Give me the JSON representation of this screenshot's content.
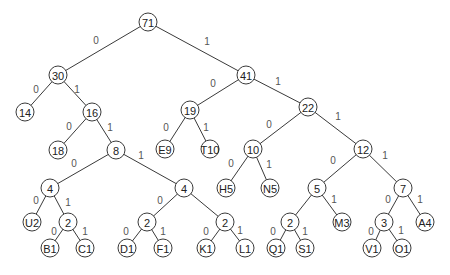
{
  "diagram": {
    "type": "huffman-tree",
    "colors": {
      "stroke": "#3a3a3a",
      "text": "#222222",
      "edge_label": "#555555",
      "background": "#ffffff"
    },
    "node_radius": 9,
    "nodes": [
      {
        "id": "n71",
        "label": "71",
        "x": 148,
        "y": 22
      },
      {
        "id": "n30",
        "label": "30",
        "x": 58,
        "y": 75
      },
      {
        "id": "n41",
        "label": "41",
        "x": 246,
        "y": 75
      },
      {
        "id": "n14",
        "label": "14",
        "x": 25,
        "y": 112
      },
      {
        "id": "n16",
        "label": "16",
        "x": 92,
        "y": 112
      },
      {
        "id": "n19",
        "label": "19",
        "x": 190,
        "y": 110
      },
      {
        "id": "n22",
        "label": "22",
        "x": 308,
        "y": 107
      },
      {
        "id": "n18",
        "label": "18",
        "x": 58,
        "y": 150
      },
      {
        "id": "n8",
        "label": "8",
        "x": 116,
        "y": 150
      },
      {
        "id": "nE9",
        "label": "E9",
        "x": 165,
        "y": 149
      },
      {
        "id": "nT10",
        "label": "T10",
        "x": 210,
        "y": 149
      },
      {
        "id": "n10",
        "label": "10",
        "x": 253,
        "y": 149
      },
      {
        "id": "n12",
        "label": "12",
        "x": 363,
        "y": 149
      },
      {
        "id": "n4a",
        "label": "4",
        "x": 50,
        "y": 188
      },
      {
        "id": "n4b",
        "label": "4",
        "x": 184,
        "y": 188
      },
      {
        "id": "nH5",
        "label": "H5",
        "x": 226,
        "y": 188
      },
      {
        "id": "nN5",
        "label": "N5",
        "x": 270,
        "y": 188
      },
      {
        "id": "n5",
        "label": "5",
        "x": 317,
        "y": 188
      },
      {
        "id": "n7",
        "label": "7",
        "x": 403,
        "y": 188
      },
      {
        "id": "nU2",
        "label": "U2",
        "x": 32,
        "y": 222
      },
      {
        "id": "n2a",
        "label": "2",
        "x": 68,
        "y": 222
      },
      {
        "id": "n2b",
        "label": "2",
        "x": 147,
        "y": 222
      },
      {
        "id": "n2c",
        "label": "2",
        "x": 225,
        "y": 222
      },
      {
        "id": "n2d",
        "label": "2",
        "x": 290,
        "y": 222
      },
      {
        "id": "nM3",
        "label": "M3",
        "x": 342,
        "y": 222
      },
      {
        "id": "n3",
        "label": "3",
        "x": 384,
        "y": 222
      },
      {
        "id": "nA4",
        "label": "A4",
        "x": 425,
        "y": 222
      },
      {
        "id": "nB1",
        "label": "B1",
        "x": 50,
        "y": 248
      },
      {
        "id": "nC1",
        "label": "C1",
        "x": 85,
        "y": 248
      },
      {
        "id": "nD1",
        "label": "D1",
        "x": 127,
        "y": 248
      },
      {
        "id": "nF1",
        "label": "F1",
        "x": 163,
        "y": 248
      },
      {
        "id": "nK1",
        "label": "K1",
        "x": 206,
        "y": 248
      },
      {
        "id": "nL1",
        "label": "L1",
        "x": 245,
        "y": 248
      },
      {
        "id": "nQ1",
        "label": "Q1",
        "x": 276,
        "y": 248
      },
      {
        "id": "nS1",
        "label": "S1",
        "x": 305,
        "y": 248
      },
      {
        "id": "nV1",
        "label": "V1",
        "x": 372,
        "y": 248
      },
      {
        "id": "nO1",
        "label": "O1",
        "x": 402,
        "y": 248
      }
    ],
    "edges": [
      {
        "from": "n71",
        "to": "n30",
        "label": "0",
        "lx": 96,
        "ly": 40
      },
      {
        "from": "n71",
        "to": "n41",
        "label": "1",
        "lx": 207,
        "ly": 41
      },
      {
        "from": "n30",
        "to": "n14",
        "label": "0",
        "lx": 36,
        "ly": 89
      },
      {
        "from": "n30",
        "to": "n16",
        "label": "1",
        "lx": 77,
        "ly": 89
      },
      {
        "from": "n41",
        "to": "n19",
        "label": "0",
        "lx": 213,
        "ly": 83
      },
      {
        "from": "n41",
        "to": "n22",
        "label": "1",
        "lx": 278,
        "ly": 81
      },
      {
        "from": "n16",
        "to": "n18",
        "label": "0",
        "lx": 69,
        "ly": 126
      },
      {
        "from": "n16",
        "to": "n8",
        "label": "1",
        "lx": 110,
        "ly": 127
      },
      {
        "from": "n19",
        "to": "nE9",
        "label": "0",
        "lx": 166,
        "ly": 127
      },
      {
        "from": "n19",
        "to": "nT10",
        "label": "1",
        "lx": 206,
        "ly": 127
      },
      {
        "from": "n22",
        "to": "n10",
        "label": "0",
        "lx": 269,
        "ly": 124
      },
      {
        "from": "n22",
        "to": "n12",
        "label": "1",
        "lx": 338,
        "ly": 116
      },
      {
        "from": "n8",
        "to": "n4a",
        "label": "0",
        "lx": 74,
        "ly": 163
      },
      {
        "from": "n8",
        "to": "n4b",
        "label": "1",
        "lx": 141,
        "ly": 155
      },
      {
        "from": "n10",
        "to": "nH5",
        "label": "0",
        "lx": 231,
        "ly": 163
      },
      {
        "from": "n10",
        "to": "nN5",
        "label": "1",
        "lx": 269,
        "ly": 164
      },
      {
        "from": "n12",
        "to": "n5",
        "label": "0",
        "lx": 333,
        "ly": 160
      },
      {
        "from": "n12",
        "to": "n7",
        "label": "1",
        "lx": 385,
        "ly": 155
      },
      {
        "from": "n4a",
        "to": "nU2",
        "label": "0",
        "lx": 36,
        "ly": 200
      },
      {
        "from": "n4a",
        "to": "n2a",
        "label": "1",
        "lx": 68,
        "ly": 202
      },
      {
        "from": "n4b",
        "to": "n2b",
        "label": "0",
        "lx": 160,
        "ly": 200
      },
      {
        "from": "n4b",
        "to": "n2c",
        "label": "1",
        "lx": 0,
        "ly": 0,
        "hidden": true
      },
      {
        "from": "n5",
        "to": "n2d",
        "label": "0",
        "lx": 0,
        "ly": 0,
        "hidden": true
      },
      {
        "from": "n5",
        "to": "nM3",
        "label": "1",
        "lx": 334,
        "ly": 199
      },
      {
        "from": "n7",
        "to": "n3",
        "label": "0",
        "lx": 388,
        "ly": 199
      },
      {
        "from": "n7",
        "to": "nA4",
        "label": "1",
        "lx": 420,
        "ly": 199
      },
      {
        "from": "n2a",
        "to": "nB1",
        "label": "0",
        "lx": 54,
        "ly": 231
      },
      {
        "from": "n2a",
        "to": "nC1",
        "label": "1",
        "lx": 85,
        "ly": 231
      },
      {
        "from": "n2b",
        "to": "nD1",
        "label": "0",
        "lx": 126,
        "ly": 231
      },
      {
        "from": "n2b",
        "to": "nF1",
        "label": "1",
        "lx": 163,
        "ly": 231
      },
      {
        "from": "n2c",
        "to": "nK1",
        "label": "0",
        "lx": 206,
        "ly": 231
      },
      {
        "from": "n2c",
        "to": "nL1",
        "label": "1",
        "lx": 240,
        "ly": 230
      },
      {
        "from": "n2d",
        "to": "nQ1",
        "label": "0",
        "lx": 273,
        "ly": 231
      },
      {
        "from": "n2d",
        "to": "nS1",
        "label": "1",
        "lx": 305,
        "ly": 231
      },
      {
        "from": "n3",
        "to": "nV1",
        "label": "0",
        "lx": 371,
        "ly": 231
      },
      {
        "from": "n3",
        "to": "nO1",
        "label": "1",
        "lx": 401,
        "ly": 230
      }
    ]
  }
}
